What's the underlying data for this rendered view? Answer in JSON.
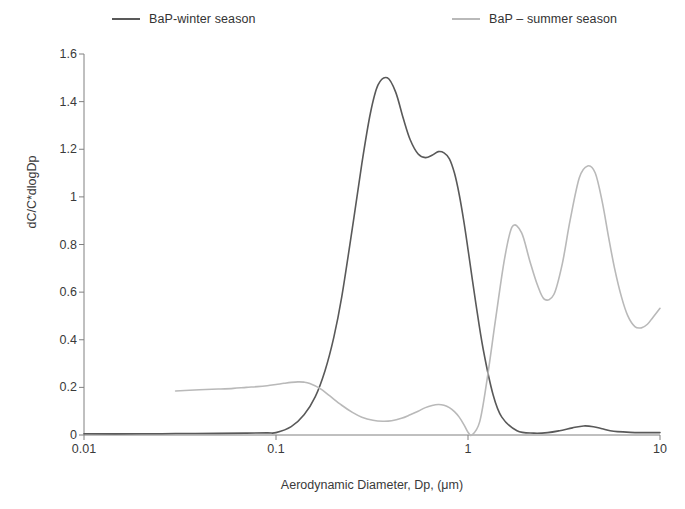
{
  "legend": {
    "position": "top",
    "entries": [
      {
        "label": "BaP-winter season",
        "color": "#595959",
        "name": "winter"
      },
      {
        "label": "BaP – summer season",
        "color": "#b9b9b9",
        "name": "summer"
      }
    ]
  },
  "axes": {
    "x": {
      "label": "Aerodynamic Diameter, Dp, (μm)",
      "scale": "log",
      "ticks": [
        "0.01",
        "0.1",
        "1",
        "10"
      ],
      "tick_values": [
        0.01,
        0.1,
        1,
        10
      ],
      "range": [
        0.01,
        10
      ]
    },
    "y": {
      "label": "dC/C*dlogDp",
      "scale": "linear",
      "ticks": [
        "0",
        "0.2",
        "0.4",
        "0.6",
        "0.8",
        "1",
        "1.2",
        "1.4",
        "1.6"
      ],
      "tick_values": [
        0,
        0.2,
        0.4,
        0.6,
        0.8,
        1,
        1.2,
        1.4,
        1.6
      ],
      "range": [
        0,
        1.6
      ]
    }
  },
  "style": {
    "axis_color": "#808080",
    "text_color": "#3a3a3a",
    "background": "#ffffff",
    "line_width": 1.6
  },
  "chart_data": {
    "type": "line",
    "title": "",
    "xlabel": "Aerodynamic Diameter, Dp, (μm)",
    "ylabel": "dC/C*dlogDp",
    "xscale": "log",
    "xlim": [
      0.01,
      10
    ],
    "ylim": [
      0,
      1.6
    ],
    "grid": false,
    "legend_position": "top",
    "series": [
      {
        "name": "BaP-winter season",
        "color": "#595959",
        "x": [
          0.01,
          0.02,
          0.03,
          0.05,
          0.07,
          0.09,
          0.1,
          0.12,
          0.14,
          0.16,
          0.18,
          0.2,
          0.22,
          0.25,
          0.28,
          0.31,
          0.34,
          0.38,
          0.42,
          0.46,
          0.5,
          0.55,
          0.6,
          0.65,
          0.7,
          0.75,
          0.8,
          0.85,
          0.9,
          0.95,
          1.0,
          1.1,
          1.2,
          1.35,
          1.5,
          1.8,
          2.2,
          2.6,
          3.0,
          3.5,
          4.0,
          4.5,
          5.0,
          5.5,
          6.0,
          7.0,
          8.0,
          9.0,
          10.0
        ],
        "y": [
          0.005,
          0.005,
          0.006,
          0.007,
          0.008,
          0.009,
          0.01,
          0.035,
          0.085,
          0.16,
          0.27,
          0.41,
          0.58,
          0.87,
          1.14,
          1.35,
          1.47,
          1.5,
          1.44,
          1.33,
          1.24,
          1.18,
          1.165,
          1.175,
          1.19,
          1.185,
          1.16,
          1.1,
          1.01,
          0.9,
          0.78,
          0.55,
          0.36,
          0.17,
          0.075,
          0.018,
          0.008,
          0.01,
          0.018,
          0.03,
          0.038,
          0.035,
          0.026,
          0.018,
          0.014,
          0.011,
          0.01,
          0.01,
          0.01
        ]
      },
      {
        "name": "BaP – summer season",
        "color": "#b9b9b9",
        "x": [
          0.03,
          0.04,
          0.05,
          0.06,
          0.07,
          0.08,
          0.09,
          0.1,
          0.11,
          0.12,
          0.13,
          0.14,
          0.15,
          0.17,
          0.19,
          0.22,
          0.25,
          0.28,
          0.32,
          0.36,
          0.4,
          0.45,
          0.5,
          0.55,
          0.6,
          0.65,
          0.7,
          0.75,
          0.8,
          0.85,
          0.9,
          0.95,
          1.0,
          1.05,
          1.15,
          1.25,
          1.4,
          1.55,
          1.7,
          1.9,
          2.1,
          2.3,
          2.5,
          2.8,
          3.1,
          3.4,
          3.8,
          4.2,
          4.6,
          5.0,
          5.4,
          5.8,
          6.3,
          6.8,
          7.4,
          8.0,
          8.6,
          9.2,
          10.0
        ],
        "y": [
          0.185,
          0.19,
          0.193,
          0.196,
          0.2,
          0.203,
          0.207,
          0.212,
          0.217,
          0.221,
          0.223,
          0.222,
          0.216,
          0.195,
          0.165,
          0.125,
          0.095,
          0.075,
          0.062,
          0.058,
          0.06,
          0.07,
          0.085,
          0.1,
          0.115,
          0.124,
          0.128,
          0.125,
          0.115,
          0.098,
          0.075,
          0.045,
          0.012,
          0.0,
          0.055,
          0.22,
          0.5,
          0.74,
          0.875,
          0.85,
          0.73,
          0.63,
          0.57,
          0.59,
          0.72,
          0.9,
          1.08,
          1.13,
          1.1,
          0.98,
          0.83,
          0.7,
          0.58,
          0.5,
          0.455,
          0.45,
          0.465,
          0.495,
          0.532
        ]
      }
    ]
  }
}
